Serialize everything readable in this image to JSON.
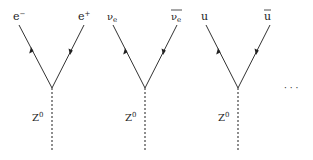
{
  "diagram": {
    "type": "feynman-vertices",
    "line_color": "#333333",
    "boson_label": "Z",
    "boson_sup": "0",
    "ellipsis": "· · ·",
    "vertices": [
      {
        "left": {
          "base": "e",
          "sup": "−",
          "sub": "",
          "bar": false
        },
        "right": {
          "base": "e",
          "sup": "+",
          "sub": "",
          "bar": false
        }
      },
      {
        "left": {
          "base": "ν",
          "sup": "",
          "sub": "e",
          "bar": false
        },
        "right": {
          "base": "ν",
          "sup": "",
          "sub": "e",
          "bar": true
        }
      },
      {
        "left": {
          "base": "u",
          "sup": "",
          "sub": "",
          "bar": false
        },
        "right": {
          "base": "u",
          "sup": "",
          "sub": "",
          "bar": true
        }
      }
    ]
  }
}
